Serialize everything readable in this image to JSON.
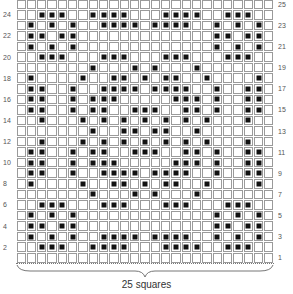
{
  "chart": {
    "columns": 25,
    "rows": 25,
    "caption": "25 squares",
    "colors": {
      "grid_line": "#9a9a9a",
      "filled": "#111111",
      "background": "#ffffff"
    },
    "left_labels": [
      "24",
      "22",
      "20",
      "18",
      "16",
      "14",
      "12",
      "10",
      "8",
      "6",
      "4",
      "2"
    ],
    "right_labels": [
      "25",
      "23",
      "21",
      "19",
      "17",
      "15",
      "13",
      "11",
      "9",
      "7",
      "5",
      "3",
      "1"
    ],
    "filled_cells_by_row": {
      "25": [],
      "24": [
        3,
        4,
        5,
        8,
        9,
        10,
        11,
        15,
        16,
        17,
        18,
        21,
        22,
        23
      ],
      "23": [
        2,
        4,
        6,
        9,
        10,
        11,
        12,
        14,
        15,
        16,
        17,
        20,
        22,
        24
      ],
      "22": [
        2,
        3,
        5,
        6,
        20,
        21,
        23,
        24
      ],
      "21": [
        2,
        4,
        6,
        20,
        22,
        24
      ],
      "20": [
        3,
        4,
        5,
        9,
        10,
        11,
        15,
        16,
        17,
        21,
        22,
        23
      ],
      "19": [
        8,
        12,
        14,
        18
      ],
      "18": [
        2,
        7,
        10,
        11,
        13,
        15,
        16,
        19,
        24
      ],
      "17": [
        2,
        3,
        6,
        9,
        10,
        11,
        12,
        14,
        15,
        16,
        17,
        20,
        23,
        24
      ],
      "16": [
        2,
        3,
        6,
        8,
        9,
        10,
        16,
        17,
        18,
        20,
        23,
        24
      ],
      "15": [
        2,
        3,
        6,
        8,
        9,
        12,
        13,
        14,
        17,
        18,
        20,
        23,
        24
      ],
      "14": [
        3,
        7,
        9,
        11,
        13,
        15,
        17,
        19,
        23
      ],
      "13": [
        8,
        11,
        12,
        14,
        15,
        18
      ],
      "12": [
        3,
        7,
        9,
        11,
        13,
        15,
        17,
        19,
        23
      ],
      "11": [
        2,
        3,
        6,
        8,
        9,
        12,
        13,
        14,
        17,
        18,
        20,
        23,
        24
      ],
      "10": [
        2,
        3,
        6,
        8,
        9,
        10,
        16,
        17,
        18,
        20,
        23,
        24
      ],
      "9": [
        2,
        3,
        6,
        9,
        10,
        11,
        12,
        14,
        15,
        16,
        17,
        20,
        23,
        24
      ],
      "8": [
        2,
        7,
        10,
        11,
        13,
        15,
        16,
        19,
        24
      ],
      "7": [
        8,
        12,
        14,
        18
      ],
      "6": [
        3,
        4,
        5,
        9,
        10,
        11,
        15,
        16,
        17,
        21,
        22,
        23
      ],
      "5": [
        2,
        4,
        6,
        20,
        22,
        24
      ],
      "4": [
        2,
        3,
        5,
        6,
        20,
        21,
        23,
        24
      ],
      "3": [
        2,
        4,
        6,
        9,
        10,
        11,
        12,
        14,
        15,
        16,
        17,
        20,
        22,
        24
      ],
      "2": [
        3,
        4,
        5,
        8,
        9,
        10,
        11,
        15,
        16,
        17,
        18,
        21,
        22,
        23
      ],
      "1": []
    }
  }
}
